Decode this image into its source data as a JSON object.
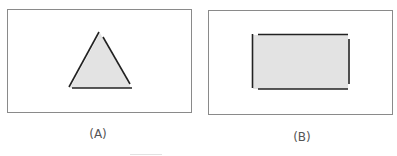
{
  "figure": {
    "panels": [
      {
        "id": "A",
        "caption": "(A)",
        "shape": "triangle",
        "description": "Gray-filled triangle with a small gap at the apex"
      },
      {
        "id": "B",
        "caption": "(B)",
        "shape": "rectangle",
        "description": "Gray-filled rectangle with gaps at all four corners"
      }
    ],
    "colors": {
      "fill": "#e3e3e3",
      "stroke": "#222222",
      "frame": "#8a8a8a",
      "caption": "#555555"
    }
  }
}
